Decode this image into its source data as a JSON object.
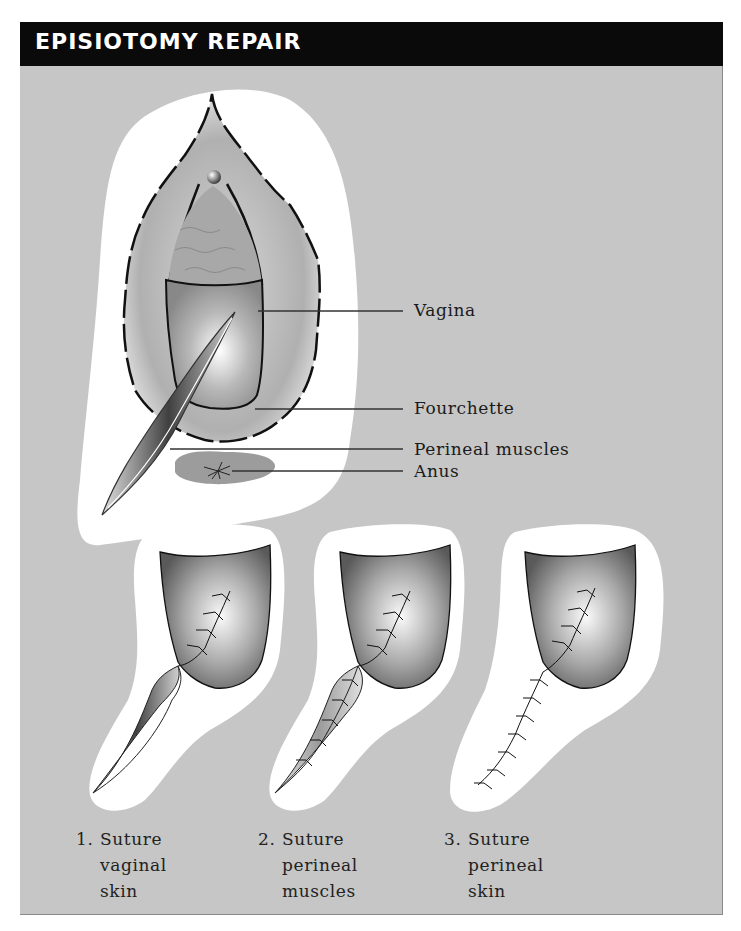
{
  "header": {
    "title": "EPISIOTOMY REPAIR"
  },
  "colors": {
    "header_bg": "#0a0a0a",
    "panel_bg": "#c6c6c6",
    "backdrop": "#ffffff",
    "tissue_dark": "#555555",
    "tissue_light": "#f4f4f4"
  },
  "main_illustration": {
    "labels": [
      {
        "id": "vagina",
        "text": "Vagina"
      },
      {
        "id": "fourchette",
        "text": "Fourchette"
      },
      {
        "id": "perineal-muscles",
        "text": "Perineal muscles"
      },
      {
        "id": "anus",
        "text": "Anus"
      }
    ]
  },
  "steps": [
    {
      "number": "1.",
      "lines": [
        "Suture",
        "vaginal",
        "skin"
      ]
    },
    {
      "number": "2.",
      "lines": [
        "Suture",
        "perineal",
        "muscles"
      ]
    },
    {
      "number": "3.",
      "lines": [
        "Suture",
        "perineal",
        "skin"
      ]
    }
  ]
}
